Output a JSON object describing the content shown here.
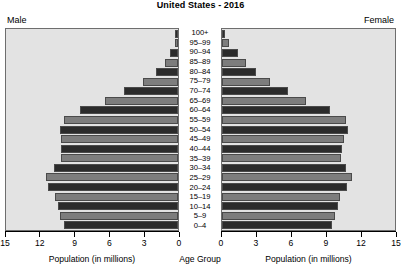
{
  "chart_data": {
    "type": "bar",
    "title": "United States - 2016",
    "subtitle": "",
    "xlabel": "Population (in millions)",
    "ylabel": "Age Group",
    "center_axis_label": "Age Group",
    "left_panel_label": "Male",
    "right_panel_label": "Female",
    "xlim": [
      0,
      15
    ],
    "grid": false,
    "legend_position": "none",
    "left_tick_labels": [
      "15",
      "12",
      "9",
      "6",
      "3",
      "0"
    ],
    "right_tick_labels": [
      "0",
      "3",
      "6",
      "9",
      "12",
      "15"
    ],
    "tick_values": [
      0,
      3,
      6,
      9,
      12,
      15
    ],
    "categories": [
      "100+",
      "95–99",
      "90–94",
      "85–89",
      "80–84",
      "75–79",
      "70–74",
      "65–69",
      "60–64",
      "55–59",
      "50–54",
      "45–49",
      "40–44",
      "35–39",
      "30–34",
      "25–29",
      "20–24",
      "15–19",
      "10–14",
      "5–9",
      "0–4"
    ],
    "series": [
      {
        "name": "Male",
        "side": "left",
        "values": [
          0.06,
          0.27,
          0.68,
          1.15,
          1.91,
          3.07,
          4.68,
          6.37,
          8.55,
          9.93,
          10.29,
          10.18,
          10.18,
          10.23,
          10.85,
          11.49,
          11.32,
          10.74,
          10.48,
          10.28,
          9.96
        ]
      },
      {
        "name": "Female",
        "side": "right",
        "values": [
          0.13,
          0.63,
          1.38,
          2.05,
          2.95,
          4.17,
          5.69,
          7.25,
          9.4,
          10.72,
          10.93,
          10.58,
          10.4,
          10.3,
          10.78,
          11.23,
          10.83,
          10.26,
          10.04,
          9.83,
          9.54
        ]
      }
    ],
    "bar_colors": {
      "dark": "#2b2b2b",
      "light": "#7d7d7d"
    },
    "panel_background": "#e3e3e3",
    "panel_border": "#6e6e6e",
    "text_color": "#000000"
  }
}
